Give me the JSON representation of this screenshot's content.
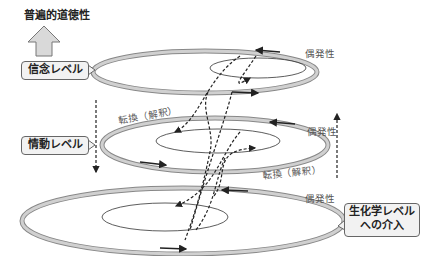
{
  "diagram": {
    "title": "普遍的道徳性",
    "levels": [
      {
        "label": "信念レベル",
        "note": "偶発性"
      },
      {
        "label": "情動レベル",
        "note": "偶発性"
      },
      {
        "label_line1": "生化学レベル",
        "label_line2": "への介入",
        "note": "偶発性"
      }
    ],
    "transitions": [
      {
        "label": "転換（解釈）"
      },
      {
        "label": "転換（解釈）"
      }
    ],
    "colors": {
      "ring": "#c8c8c8",
      "ring_border": "#888888",
      "arrow_fill": "#d9d9d9",
      "box_fill": "#f2f2f2"
    }
  }
}
